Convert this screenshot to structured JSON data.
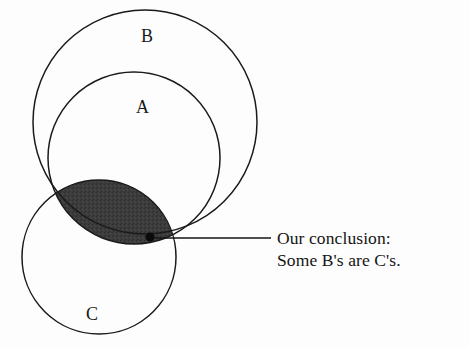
{
  "figure": {
    "type": "euler-venn-diagram",
    "background_color": "#fdfdfd",
    "stroke_color": "#1a1a1a",
    "shade_color": "#3a3a3a",
    "width": 469,
    "height": 347
  },
  "sets": [
    {
      "id": "B",
      "label": "B",
      "cx": 145,
      "cy": 122,
      "r": 112,
      "label_x": 141,
      "label_y": 27
    },
    {
      "id": "A",
      "label": "A",
      "cx": 134,
      "cy": 158,
      "r": 86,
      "label_x": 136,
      "label_y": 98
    },
    {
      "id": "C",
      "label": "C",
      "cx": 99,
      "cy": 257,
      "r": 77,
      "label_x": 86,
      "label_y": 305
    }
  ],
  "shaded_region": {
    "name": "A-intersect-C",
    "sets": [
      "A",
      "C"
    ],
    "fill": "#3a3a3a",
    "description": "Overlap of circle A and circle C, shaded dark"
  },
  "callout": {
    "anchor_dot": {
      "x": 150,
      "y": 237,
      "r": 4.5
    },
    "leader_line": {
      "x1": 152,
      "y1": 238,
      "x2": 271,
      "y2": 238
    },
    "lines": [
      "Our conclusion:",
      "Some B's are C's."
    ],
    "text_x": 277,
    "text_y": 227
  }
}
